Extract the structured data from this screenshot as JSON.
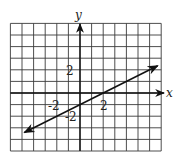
{
  "chart_data": {
    "type": "line",
    "title": "",
    "xlabel": "x",
    "ylabel": "y",
    "xlim": [
      -6,
      7
    ],
    "ylim": [
      -5,
      6
    ],
    "grid": true,
    "grid_step": 1,
    "tick_labels": {
      "x": [
        {
          "value": -2,
          "label": "-2"
        },
        {
          "value": 2,
          "label": "2"
        }
      ],
      "y": [
        {
          "value": 2,
          "label": "2"
        },
        {
          "value": -2,
          "label": "-2"
        }
      ]
    },
    "series": [
      {
        "name": "line",
        "equation": "y = x/2 - 1",
        "slope": 0.5,
        "intercept": -1,
        "x": [
          -4.8,
          6.7
        ],
        "y": [
          -3.4,
          2.35
        ],
        "arrows": "both"
      }
    ],
    "legend": null
  },
  "labels": {
    "x_axis": "x",
    "y_axis": "y",
    "x_tick_neg2": "-2",
    "x_tick_2": "2",
    "y_tick_2": "2",
    "y_tick_neg2": "-2"
  },
  "colors": {
    "grid": "#3a3a3a",
    "axis": "#111111",
    "line": "#111111"
  }
}
